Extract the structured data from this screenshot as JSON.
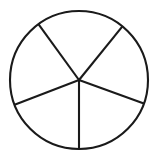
{
  "figure": {
    "name": "fraction-circle-diagram",
    "title": "Circle divided into five sectors with two shaded",
    "background_color": "#ffffff",
    "stroke_color": "#1a1a1a",
    "stroke_width": 2.1,
    "shaded_color": "#e3e3e3",
    "unshaded_color": "#ffffff",
    "total_parts": 5,
    "shaded_parts": 2,
    "fraction_label": "2/5"
  },
  "chart_data": {
    "type": "pie",
    "title": "Circle divided into five sectors with two shaded",
    "xlabel": "",
    "ylabel": "",
    "center_x": 79,
    "center_y": 80,
    "radius": 69,
    "grid": false,
    "legend_position": "none",
    "labels_visible": false,
    "categories": [
      "top-sector",
      "upper-left-sector",
      "lower-left-sector",
      "lower-right-sector",
      "right-sector"
    ],
    "values": [
      75,
      75,
      69,
      70,
      71
    ],
    "units": "degrees",
    "series": [
      {
        "name": "sectors",
        "values": [
          75,
          75,
          69,
          70,
          71
        ]
      }
    ],
    "slices": [
      {
        "name": "top-sector",
        "start_angle": -126,
        "end_angle": -51,
        "sweep": 75,
        "shaded": true,
        "fill": "#e3e3e3"
      },
      {
        "name": "upper-left-sector",
        "start_angle": -201,
        "end_angle": -126,
        "sweep": 75,
        "shaded": true,
        "fill": "#e3e3e3"
      },
      {
        "name": "lower-left-sector",
        "start_angle": 159,
        "end_angle": 90,
        "sweep": 69,
        "shaded": false,
        "fill": "#ffffff"
      },
      {
        "name": "lower-right-sector",
        "start_angle": 20,
        "end_angle": 90,
        "sweep": 70,
        "shaded": false,
        "fill": "#ffffff"
      },
      {
        "name": "right-sector",
        "start_angle": -51,
        "end_angle": 20,
        "sweep": 71,
        "shaded": false,
        "fill": "#ffffff"
      }
    ],
    "spokes": [
      {
        "name": "spoke-upper-right",
        "angle": -51,
        "end_x": 122.4,
        "end_y": 26.4
      },
      {
        "name": "spoke-upper-left",
        "angle": -126,
        "end_x": 38.4,
        "end_y": 24.2
      },
      {
        "name": "spoke-left",
        "angle": 159,
        "end_x": 14.6,
        "end_y": 104.7
      },
      {
        "name": "spoke-bottom",
        "angle": 90,
        "end_x": 79.0,
        "end_y": 149.0
      },
      {
        "name": "spoke-right",
        "angle": 20,
        "end_x": 143.8,
        "end_y": 103.6
      }
    ]
  }
}
